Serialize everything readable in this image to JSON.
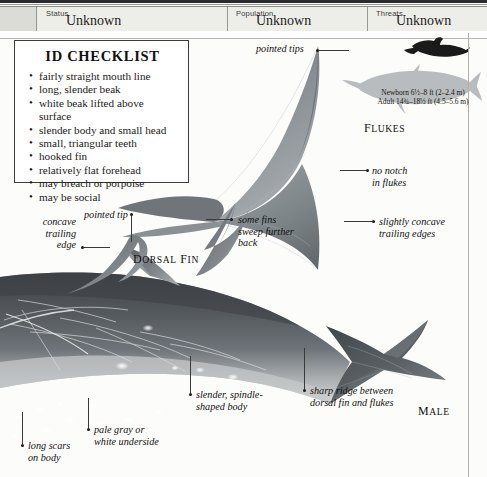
{
  "header": {
    "fields": [
      {
        "label": "Status",
        "value": "Unknown"
      },
      {
        "label": "Population",
        "value": "Unknown"
      },
      {
        "label": "Threats",
        "value": "Unknown"
      }
    ]
  },
  "checklist": {
    "title": "ID CHECKLIST",
    "items": [
      "fairly straight mouth line",
      "long, slender beak",
      "white beak lifted above surface",
      "slender body and small head",
      "small, triangular teeth",
      "hooked fin",
      "relatively flat forehead",
      "may breach or porpoise",
      "may be social"
    ]
  },
  "scale": {
    "newborn": "Newborn 6½–8 ft (2–2.4 m)",
    "adult": "Adult 14¾–18½ ft (4.5–5.6 m)"
  },
  "captions": {
    "flukes": "FLUKES",
    "dorsal_fin": "DORSAL FIN",
    "male": "MALE"
  },
  "annotations": {
    "pointed_tips": "pointed tips",
    "no_notch": "no notch\nin flukes",
    "slightly_concave": "slightly concave\ntrailing edges",
    "pointed_tip": "pointed tip",
    "concave_trailing_edge": "concave\ntrailing\nedge",
    "some_fins": "some fins\nsweep further\nback",
    "sharp_ridge": "sharp ridge between\ndorsal fin and flukes",
    "slender_body": "slender, spindle-\nshaped body",
    "pale_gray": "pale gray or\nwhite underside",
    "long_scars": "long scars\non body"
  },
  "colors": {
    "body_dark": "#4a4e52",
    "body_mid": "#6e7479",
    "body_light": "#c9ccce",
    "silhouette_gray": "#b9bcbe",
    "silhouette_black": "#1a1a1a",
    "rule": "#3a3a38",
    "panel": "#eeeee9"
  }
}
